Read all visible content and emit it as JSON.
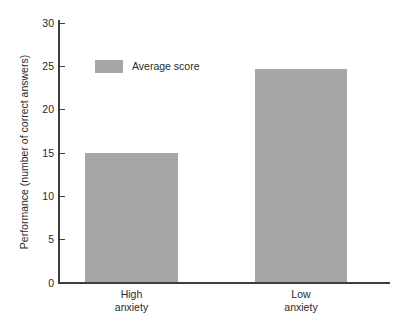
{
  "chart_data": {
    "type": "bar",
    "title": "",
    "subtitle": "",
    "xlabel": "",
    "ylabel": "Performance (number of correct answers)",
    "categories": [
      "High anxiety",
      "Low anxiety"
    ],
    "category_lines": [
      [
        "High",
        "anxiety"
      ],
      [
        "Low",
        "anxiety"
      ]
    ],
    "values": [
      14.9,
      24.6
    ],
    "series": [
      {
        "name": "Average score",
        "values": [
          14.9,
          24.6
        ]
      }
    ],
    "ylim": [
      0,
      30
    ],
    "yticks": [
      0,
      5,
      10,
      15,
      20,
      25,
      30
    ],
    "ytick_labels": [
      "0",
      "5",
      "10",
      "15",
      "20",
      "25",
      "30"
    ],
    "grid": false,
    "legend": {
      "position": "upper-left-inside",
      "entries": [
        {
          "label": "Average score",
          "color": "#a6a6a6"
        }
      ]
    },
    "colors": {
      "bar": "#a6a6a6",
      "axis": "#3d3d3d",
      "text": "#2a2a2a",
      "background": "#ffffff"
    }
  }
}
